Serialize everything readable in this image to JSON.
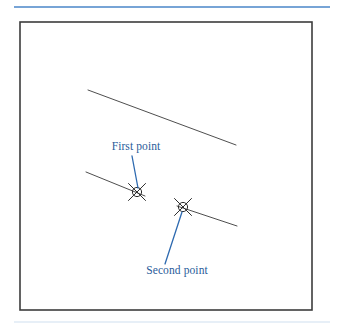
{
  "figure": {
    "background_color": "#ffffff",
    "top_rule": {
      "name": "top-divider",
      "color": "#4a86c8",
      "x1": 14,
      "y1": 7,
      "x2": 330,
      "y2": 7,
      "width": 1.6
    },
    "bottom_rule": {
      "name": "bottom-divider",
      "color": "#cfe0ef",
      "x1": 14,
      "y1": 322,
      "x2": 330,
      "y2": 322,
      "width": 1.2
    },
    "frame": {
      "name": "drawing-frame",
      "color": "#3c3c3c",
      "x": 20,
      "y": 22,
      "width": 292,
      "height": 288,
      "stroke_width": 1.6,
      "fill": "#ffffff"
    }
  },
  "geometry": {
    "line_color": "#3a3a3a",
    "line_width": 0.9,
    "lines": [
      {
        "name": "upper-line",
        "label": "Upper line",
        "x1": 88,
        "y1": 90,
        "x2": 236,
        "y2": 145
      },
      {
        "name": "lower-left-line",
        "label": "Lower left line",
        "x1": 86,
        "y1": 172,
        "x2": 145,
        "y2": 196
      },
      {
        "name": "lower-right-line",
        "label": "Lower right line",
        "x1": 177,
        "y1": 206,
        "x2": 237,
        "y2": 226
      }
    ]
  },
  "snap_markers": [
    {
      "name": "first-point-marker",
      "glyph": "circle-x-snap-icon",
      "cx": 137,
      "cy": 192,
      "radius": 4.6,
      "color": "#2e2e2e"
    },
    {
      "name": "second-point-marker",
      "glyph": "circle-x-snap-icon",
      "cx": 183,
      "cy": 207,
      "radius": 4.6,
      "color": "#2e2e2e"
    }
  ],
  "annotations": [
    {
      "name": "first-point-annotation",
      "text": "First point",
      "text_x": 136,
      "text_y": 150,
      "text_anchor": "middle",
      "color": "#2a5c9a",
      "leader": {
        "name": "first-point-leader",
        "color": "#2e6ab0",
        "width": 1.3,
        "x1": 132,
        "y1": 156,
        "x2": 138,
        "y2": 188
      }
    },
    {
      "name": "second-point-annotation",
      "text": "Second point",
      "text_x": 177,
      "text_y": 274,
      "text_anchor": "middle",
      "color": "#2a5c9a",
      "leader": {
        "name": "second-point-leader",
        "color": "#2e6ab0",
        "width": 1.3,
        "x1": 165,
        "y1": 264,
        "x2": 182,
        "y2": 212
      }
    }
  ]
}
